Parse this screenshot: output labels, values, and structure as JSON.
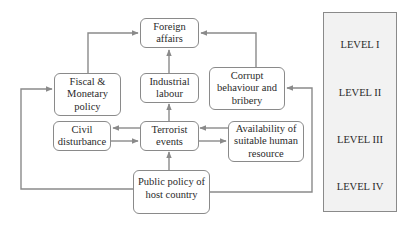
{
  "diagram": {
    "title": "",
    "colors": {
      "line": "#8a8a8a",
      "box_border": "#8a8a8a",
      "panel_fill": "#f2f2f2",
      "text": "#2a2a2a"
    },
    "nodes": {
      "foreign_affairs": "Foreign\naffairs",
      "fiscal_monetary": "Fiscal &\nMonetary\npolicy",
      "industrial_labour": "Industrial\nlabour",
      "corrupt_behaviour": "Corrupt\nbehaviour and\nbribery",
      "civil_disturbance": "Civil\ndisturbance",
      "terrorist_events": "Terrorist\nevents",
      "human_resource": "Availability of\nsuitable human\nresource",
      "public_policy": "Public policy of\nhost country"
    },
    "levels": [
      "LEVEL I",
      "LEVEL II",
      "LEVEL III",
      "LEVEL IV"
    ],
    "edges": [
      {
        "from": "fiscal_monetary",
        "to": "foreign_affairs"
      },
      {
        "from": "industrial_labour",
        "to": "foreign_affairs"
      },
      {
        "from": "corrupt_behaviour",
        "to": "foreign_affairs"
      },
      {
        "from": "terrorist_events",
        "to": "industrial_labour"
      },
      {
        "from": "terrorist_events",
        "to": "civil_disturbance"
      },
      {
        "from": "civil_disturbance",
        "to": "terrorist_events"
      },
      {
        "from": "human_resource",
        "to": "terrorist_events"
      },
      {
        "from": "terrorist_events",
        "to": "human_resource"
      },
      {
        "from": "public_policy",
        "to": "terrorist_events"
      },
      {
        "from": "public_policy",
        "to": "fiscal_monetary"
      },
      {
        "from": "public_policy",
        "to": "corrupt_behaviour"
      }
    ]
  }
}
